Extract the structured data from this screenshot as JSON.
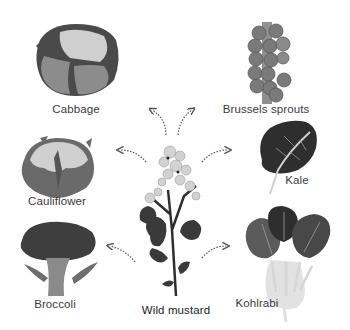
{
  "diagram": {
    "center": {
      "name": "Wild mustard",
      "label": "Wild mustard"
    },
    "derivatives": [
      {
        "id": "cabbage",
        "label": "Cabbage"
      },
      {
        "id": "brussels-sprouts",
        "label": "Brussels sprouts"
      },
      {
        "id": "cauliflower",
        "label": "Cauliflower"
      },
      {
        "id": "kale",
        "label": "Kale"
      },
      {
        "id": "broccoli",
        "label": "Broccoli"
      },
      {
        "id": "kohlrabi",
        "label": "Kohlrabi"
      }
    ],
    "colors": {
      "background": "#ffffff",
      "dark_leaf": "#3c3c3c",
      "mid_leaf": "#6e6e6e",
      "light_head": "#c8c8c8",
      "pale_stem": "#dcdcdc",
      "arrow": "#555555",
      "text": "#3a3a3a"
    }
  }
}
